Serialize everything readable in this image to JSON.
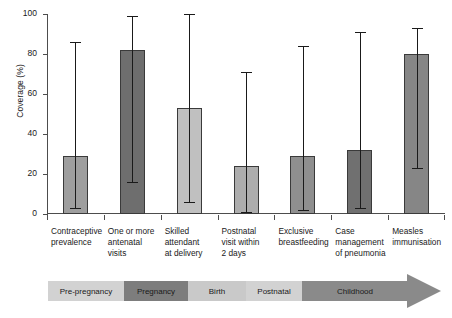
{
  "chart_data": {
    "type": "bar",
    "title": "",
    "subtitle": "",
    "xlabel": "",
    "ylabel": "Coverage (%)",
    "ylim": [
      0,
      100
    ],
    "yticks": [
      0,
      20,
      40,
      60,
      80,
      100
    ],
    "grid": false,
    "legend": "none",
    "categories": [
      "Contraceptive prevalence",
      "One or more antenatal visits",
      "Skilled attendant at delivery",
      "Postnatal visit within 2 days",
      "Exclusive breastfeeding",
      "Case management of pneumonia",
      "Measles immunisation"
    ],
    "category_lines": [
      [
        "Contraceptive",
        "prevalence"
      ],
      [
        "One or more",
        "antenatal",
        "visits"
      ],
      [
        "Skilled",
        "attendant",
        "at delivery"
      ],
      [
        "Postnatal",
        "visit within",
        "2 days"
      ],
      [
        "Exclusive",
        "breastfeeding"
      ],
      [
        "Case",
        "management",
        "of pneumonia"
      ],
      [
        "Measles",
        "immunisation"
      ]
    ],
    "values": [
      29,
      82,
      53,
      24,
      29,
      32,
      80
    ],
    "error_low": [
      3,
      16,
      6,
      1,
      2,
      3,
      23
    ],
    "error_high": [
      86,
      99,
      100,
      71,
      84,
      91,
      93
    ],
    "bar_colors": [
      "#9e9e9e",
      "#6e6e6e",
      "#c0c0c0",
      "#adadad",
      "#8f8f8f",
      "#707070",
      "#868686"
    ]
  },
  "timeline": {
    "segments": [
      {
        "label": "Pre-pregnancy",
        "color": "#d2d2d2",
        "width": 76
      },
      {
        "label": "Pregnancy",
        "color": "#7d7d7d",
        "width": 64
      },
      {
        "label": "Birth",
        "color": "#c9c9c9",
        "width": 58
      },
      {
        "label": "Postnatal",
        "color": "#d2d2d2",
        "width": 56
      },
      {
        "label": "Childhood",
        "color": "#8a8a8a",
        "width": 106
      }
    ]
  }
}
